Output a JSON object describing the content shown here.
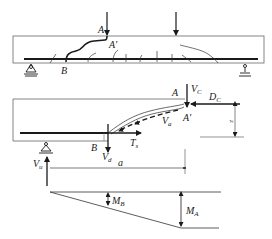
{
  "figure": {
    "top_panel": {
      "description": "Beam with two point loads showing diagonal shear crack A-A'-B and flexural cracks",
      "labels": {
        "A": "A",
        "A_prime": "A'",
        "B": "B"
      }
    },
    "middle_panel": {
      "description": "Free body of beam segment left of diagonal crack",
      "labels": {
        "A": "A",
        "A_prime": "A'",
        "B": "B",
        "V_C": "V",
        "V_C_sub": "C",
        "D_C": "D",
        "D_C_sub": "C",
        "V_a": "V",
        "V_a_sub": "a",
        "T_s": "T",
        "T_s_sub": "s",
        "V_d": "V",
        "V_d_sub": "d",
        "V_u": "V",
        "V_u_sub": "u",
        "a": "a",
        "z": "z"
      }
    },
    "bottom_panel": {
      "description": "Bending moment diagram",
      "labels": {
        "M_B": "M",
        "M_B_sub": "B",
        "M_A": "M",
        "M_A_sub": "A"
      }
    },
    "colors": {
      "line": "#1a1a1a",
      "beam_outline": "#555555",
      "crack": "#333333"
    }
  }
}
